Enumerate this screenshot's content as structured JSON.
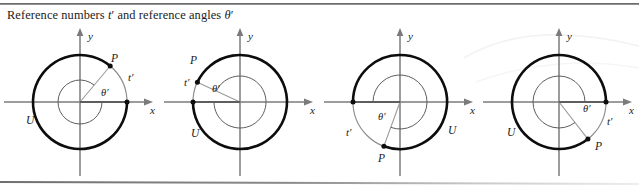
{
  "figure": {
    "caption_prefix": "Reference numbers ",
    "caption_var1": "t",
    "caption_prime1": "′",
    "caption_middle": " and reference angles ",
    "caption_var2": "θ",
    "caption_prime2": "′",
    "caption_full": "Reference numbers t′ and reference angles θ′",
    "colors": {
      "axis": "#7b7b7b",
      "circle": "#8d8d8d",
      "arc": "#0d0d0d",
      "ray": "#9a9a9a",
      "text": "#1a1a1a",
      "rule": "#6d6d6d",
      "smudge": "#e3e3e3"
    },
    "geometry": {
      "cx": 80,
      "cy": 78,
      "r": 47,
      "x_axis_label": "x",
      "y_axis_label": "y",
      "circle_label": "U",
      "point_label": "P",
      "arc_label": "t′",
      "angle_label": "θ′"
    }
  },
  "panels": [
    {
      "name": "quadrant-i",
      "quadrant": 1,
      "point_angle_deg": 50,
      "terminal_angle_deg": 50,
      "reference_from_deg": 0,
      "arc_start_deg": 0,
      "arc_end_deg": 50,
      "angle_arc_radius": 22,
      "labels": {
        "x_axis": "x",
        "y_axis": "y",
        "circle": "U",
        "point": "P",
        "arc": "t′",
        "angle": "θ′"
      },
      "label_pos": {
        "point": {
          "x": 111,
          "y": 38
        },
        "arc": {
          "x": 128,
          "y": 57
        },
        "angle": {
          "x": 101,
          "y": 72
        },
        "circle": {
          "x": 26,
          "y": 100
        },
        "x_axis": {
          "x": 150,
          "y": 90
        },
        "y_axis": {
          "x": 88,
          "y": 16
        }
      }
    },
    {
      "name": "quadrant-ii",
      "quadrant": 2,
      "point_angle_deg": 155,
      "terminal_angle_deg": 155,
      "reference_from_deg": 180,
      "arc_start_deg": 155,
      "arc_end_deg": 180,
      "angle_arc_radius": 26,
      "labels": {
        "x_axis": "x",
        "y_axis": "y",
        "circle": "U",
        "point": "P",
        "arc": "t′",
        "angle": "θ′"
      },
      "label_pos": {
        "point": {
          "x": 30,
          "y": 40
        },
        "arc": {
          "x": 24,
          "y": 62
        },
        "angle": {
          "x": 52,
          "y": 68
        },
        "circle": {
          "x": 31,
          "y": 113
        },
        "x_axis": {
          "x": 150,
          "y": 90
        },
        "y_axis": {
          "x": 88,
          "y": 16
        }
      }
    },
    {
      "name": "quadrant-iii",
      "quadrant": 3,
      "point_angle_deg": 250,
      "terminal_angle_deg": 250,
      "reference_from_deg": 180,
      "arc_start_deg": 180,
      "arc_end_deg": 250,
      "angle_arc_radius": 27,
      "labels": {
        "x_axis": "x",
        "y_axis": "y",
        "circle": "U",
        "point": "P",
        "arc": "t′",
        "angle": "θ′"
      },
      "label_pos": {
        "point": {
          "x": 58,
          "y": 138
        },
        "arc": {
          "x": 26,
          "y": 112
        },
        "angle": {
          "x": 58,
          "y": 96
        },
        "circle": {
          "x": 128,
          "y": 110
        },
        "x_axis": {
          "x": 150,
          "y": 90
        },
        "y_axis": {
          "x": 88,
          "y": 16
        }
      }
    },
    {
      "name": "quadrant-iv",
      "quadrant": 4,
      "point_angle_deg": -52,
      "terminal_angle_deg": -52,
      "reference_from_deg": 0,
      "arc_start_deg": -52,
      "arc_end_deg": 0,
      "angle_arc_radius": 26,
      "labels": {
        "x_axis": "x",
        "y_axis": "y",
        "circle": "U",
        "point": "P",
        "arc": "t′",
        "angle": "θ′"
      },
      "label_pos": {
        "point": {
          "x": 116,
          "y": 126
        },
        "arc": {
          "x": 128,
          "y": 101
        },
        "angle": {
          "x": 104,
          "y": 88
        },
        "circle": {
          "x": 28,
          "y": 112
        },
        "x_axis": {
          "x": 150,
          "y": 90
        },
        "y_axis": {
          "x": 88,
          "y": 16
        }
      }
    }
  ]
}
